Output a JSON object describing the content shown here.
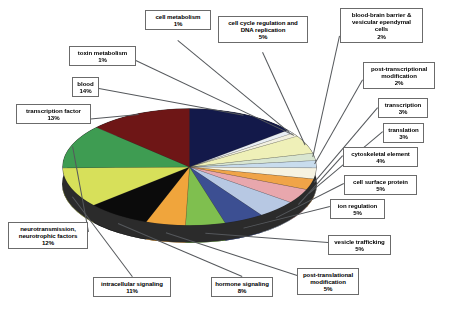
{
  "chart_data": {
    "type": "pie",
    "title": "",
    "subtitle": "",
    "xlabel": "",
    "ylabel": "",
    "legend_position": "callout-labels",
    "grid": false,
    "units": "percent",
    "total": 100,
    "categories": [
      "blood",
      "cell metabolism",
      "toxin metabolism",
      "cell cycle regulation and DNA replication",
      "blood-brain barrier & vesicular ependymal cells",
      "post-transcriptional modification",
      "transcription",
      "translation",
      "cytoskeletal element",
      "cell surface protein",
      "ion regulation",
      "vesicle trafficking",
      "post-translational modification",
      "hormone signaling",
      "intracellular signaling",
      "neurotransmission, neurotrophic factors",
      "transcription factor"
    ],
    "values": [
      14,
      1,
      1,
      5,
      2,
      2,
      3,
      3,
      4,
      5,
      5,
      5,
      5,
      8,
      11,
      12,
      13
    ],
    "colors": [
      "#13194a",
      "#e8edf4",
      "#f2f0e0",
      "#eff0b8",
      "#d9e6d1",
      "#c8dced",
      "#f6f3e2",
      "#f0a448",
      "#e8a7ad",
      "#b7c8e3",
      "#3c4f92",
      "#7fbf4f",
      "#f0a53c",
      "#0b0b0b",
      "#d7e05a",
      "#3e9c52",
      "#6e1616"
    ],
    "slices": [
      {
        "label": "blood",
        "value": 14,
        "color": "#13194a"
      },
      {
        "label": "cell metabolism",
        "value": 1,
        "color": "#e8edf4"
      },
      {
        "label": "toxin metabolism",
        "value": 1,
        "color": "#f2f0e0"
      },
      {
        "label": "cell cycle regulation and DNA replication",
        "value": 5,
        "color": "#eff0b8"
      },
      {
        "label": "blood-brain barrier & vesicular ependymal cells",
        "value": 2,
        "color": "#d9e6d1"
      },
      {
        "label": "post-transcriptional modification",
        "value": 2,
        "color": "#c8dced"
      },
      {
        "label": "transcription",
        "value": 3,
        "color": "#f6f3e2"
      },
      {
        "label": "translation",
        "value": 3,
        "color": "#f0a448"
      },
      {
        "label": "cytoskeletal element",
        "value": 4,
        "color": "#e8a7ad"
      },
      {
        "label": "cell surface protein",
        "value": 5,
        "color": "#b7c8e3"
      },
      {
        "label": "ion regulation",
        "value": 5,
        "color": "#3c4f92"
      },
      {
        "label": "vesicle trafficking",
        "value": 5,
        "color": "#7fbf4f"
      },
      {
        "label": "post-translational modification",
        "value": 5,
        "color": "#f0a53c"
      },
      {
        "label": "hormone signaling",
        "value": 8,
        "color": "#0b0b0b"
      },
      {
        "label": "intracellular signaling",
        "value": 11,
        "color": "#d7e05a"
      },
      {
        "label": "neurotransmission, neurotrophic factors",
        "value": 12,
        "color": "#3e9c52"
      },
      {
        "label": "transcription factor",
        "value": 13,
        "color": "#6e1616"
      }
    ]
  },
  "callouts": [
    {
      "id": "cell-metabolism",
      "name": "cell metabolism",
      "pct": "1%"
    },
    {
      "id": "toxin-metabolism",
      "name": "toxin metabolism",
      "pct": "1%"
    },
    {
      "id": "blood",
      "name": "blood",
      "pct": "14%"
    },
    {
      "id": "transcription-factor",
      "name": "transcription factor",
      "pct": "13%"
    },
    {
      "id": "cell-cycle",
      "name": "cell cycle regulation and DNA replication",
      "pct": "5%"
    },
    {
      "id": "blood-brain-barrier",
      "name": "blood-brain barrier & vesicular ependymal cells",
      "pct": "2%"
    },
    {
      "id": "post-transcriptional",
      "name": "post-transcriptional modification",
      "pct": "2%"
    },
    {
      "id": "transcription",
      "name": "transcription",
      "pct": "3%"
    },
    {
      "id": "translation",
      "name": "translation",
      "pct": "3%"
    },
    {
      "id": "cytoskeletal-element",
      "name": "cytoskeletal element",
      "pct": "4%"
    },
    {
      "id": "cell-surface-protein",
      "name": "cell surface protein",
      "pct": "5%"
    },
    {
      "id": "ion-regulation",
      "name": "ion regulation",
      "pct": "5%"
    },
    {
      "id": "vesicle-trafficking",
      "name": "vesicle trafficking",
      "pct": "5%"
    },
    {
      "id": "post-translational",
      "name": "post-translational modification",
      "pct": "5%"
    },
    {
      "id": "hormone-signaling",
      "name": "hormone signaling",
      "pct": "8%"
    },
    {
      "id": "intracellular-signaling",
      "name": "intracellular signaling",
      "pct": "11%"
    },
    {
      "id": "neurotransmission",
      "name": "neurotransmission, neurotrophic factors",
      "pct": "12%"
    }
  ],
  "labels": {
    "cell_metabolism": {
      "line1": "cell metabolism",
      "line2": "",
      "line3": "",
      "pct": "1%"
    },
    "toxin_metabolism": {
      "line1": "toxin metabolism",
      "line2": "",
      "line3": "",
      "pct": "1%"
    },
    "blood": {
      "line1": "blood",
      "line2": "",
      "line3": "",
      "pct": "14%"
    },
    "transcription_factor": {
      "line1": "transcription factor",
      "line2": "",
      "line3": "",
      "pct": "13%"
    },
    "cell_cycle": {
      "line1": "cell cycle regulation and",
      "line2": "DNA replication",
      "line3": "",
      "pct": "5%"
    },
    "blood_brain_barrier": {
      "line1": "blood-brain barrier &",
      "line2": "vesicular ependymal",
      "line3": "cells",
      "pct": "2%"
    },
    "post_transcriptional": {
      "line1": "post-transcriptional",
      "line2": "modification",
      "line3": "",
      "pct": "2%"
    },
    "transcription": {
      "line1": "transcription",
      "line2": "",
      "line3": "",
      "pct": "3%"
    },
    "translation": {
      "line1": "translation",
      "line2": "",
      "line3": "",
      "pct": "3%"
    },
    "cytoskeletal_element": {
      "line1": "cytoskeletal element",
      "line2": "",
      "line3": "",
      "pct": "4%"
    },
    "cell_surface_protein": {
      "line1": "cell surface protein",
      "line2": "",
      "line3": "",
      "pct": "5%"
    },
    "ion_regulation": {
      "line1": "ion regulation",
      "line2": "",
      "line3": "",
      "pct": "5%"
    },
    "vesicle_trafficking": {
      "line1": "vesicle trafficking",
      "line2": "",
      "line3": "",
      "pct": "5%"
    },
    "post_translational": {
      "line1": "post-translational",
      "line2": "modification",
      "line3": "",
      "pct": "5%"
    },
    "hormone_signaling": {
      "line1": "hormone signaling",
      "line2": "",
      "line3": "",
      "pct": "8%"
    },
    "intracellular_signaling": {
      "line1": "intracellular signaling",
      "line2": "",
      "line3": "",
      "pct": "11%"
    },
    "neurotransmission": {
      "line1": "neurotransmission,",
      "line2": "neurotrophic factors",
      "line3": "",
      "pct": "12%"
    }
  }
}
